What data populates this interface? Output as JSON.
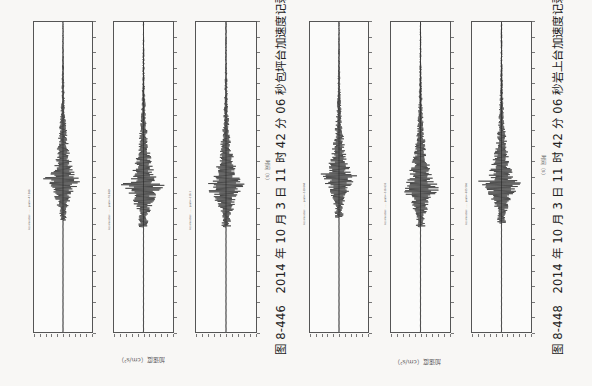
{
  "figures": [
    {
      "id": "left",
      "caption": "图 8-446　2014 年 10 月 3 日 11 时 42 分 06 秒包坪台加速度记录",
      "ylabel": "加速度（cm/s²）",
      "xlabel": "时间（s）",
      "panels": [
        {
          "title": "Acceleration: ...... peak=-47.068"
        },
        {
          "title": "Acceleration: ...... peak=-78.689"
        },
        {
          "title": "Acceleration: ...... peak=-118.1"
        }
      ]
    },
    {
      "id": "right",
      "caption": "图 8-448　2014 年 10 月 3 日 11 时 42 分 06 秒岩上台加速度记录",
      "ylabel": "加速度（cm/s²）",
      "xlabel": "时间（s）",
      "panels": [
        {
          "title": "Acceleration: ...... peak=-339.844"
        },
        {
          "title": "Acceleration: ...... peak=-318.633"
        },
        {
          "title": "Acceleration: ...... peak=-205.566"
        }
      ]
    }
  ],
  "chart_data": [
    {
      "type": "line",
      "title": "图 8-446 包坪台加速度记录",
      "xlabel": "时间（s）",
      "ylabel": "加速度（cm/s²）",
      "orientation": "rotated 90° (time runs bottom-to-top, amplitude horizontal)",
      "series": [
        {
          "name": "Component 1",
          "burst_center_frac": 0.5,
          "max_abs_amplitude_frac": 0.9,
          "onset_frac": 0.38,
          "decay_to_frac": 0.95
        },
        {
          "name": "Component 2",
          "burst_center_frac": 0.52,
          "max_abs_amplitude_frac": 1.0,
          "onset_frac": 0.4,
          "decay_to_frac": 0.95
        },
        {
          "name": "Component 3",
          "burst_center_frac": 0.52,
          "max_abs_amplitude_frac": 1.0,
          "onset_frac": 0.43,
          "decay_to_frac": 0.95
        }
      ],
      "time_ticks": 21,
      "grid": false
    },
    {
      "type": "line",
      "title": "图 8-448 岩上台加速度记录",
      "xlabel": "时间（s）",
      "ylabel": "加速度（cm/s²）",
      "orientation": "rotated 90° (time runs bottom-to-top, amplitude horizontal)",
      "series": [
        {
          "name": "Component 1",
          "burst_center_frac": 0.49,
          "max_abs_amplitude_frac": 0.9,
          "onset_frac": 0.37,
          "decay_to_frac": 0.95
        },
        {
          "name": "Component 2",
          "burst_center_frac": 0.52,
          "max_abs_amplitude_frac": 1.0,
          "onset_frac": 0.38,
          "decay_to_frac": 0.95
        },
        {
          "name": "Component 3",
          "burst_center_frac": 0.51,
          "max_abs_amplitude_frac": 1.0,
          "onset_frac": 0.42,
          "decay_to_frac": 0.95
        }
      ],
      "time_ticks": 21,
      "grid": false
    }
  ]
}
